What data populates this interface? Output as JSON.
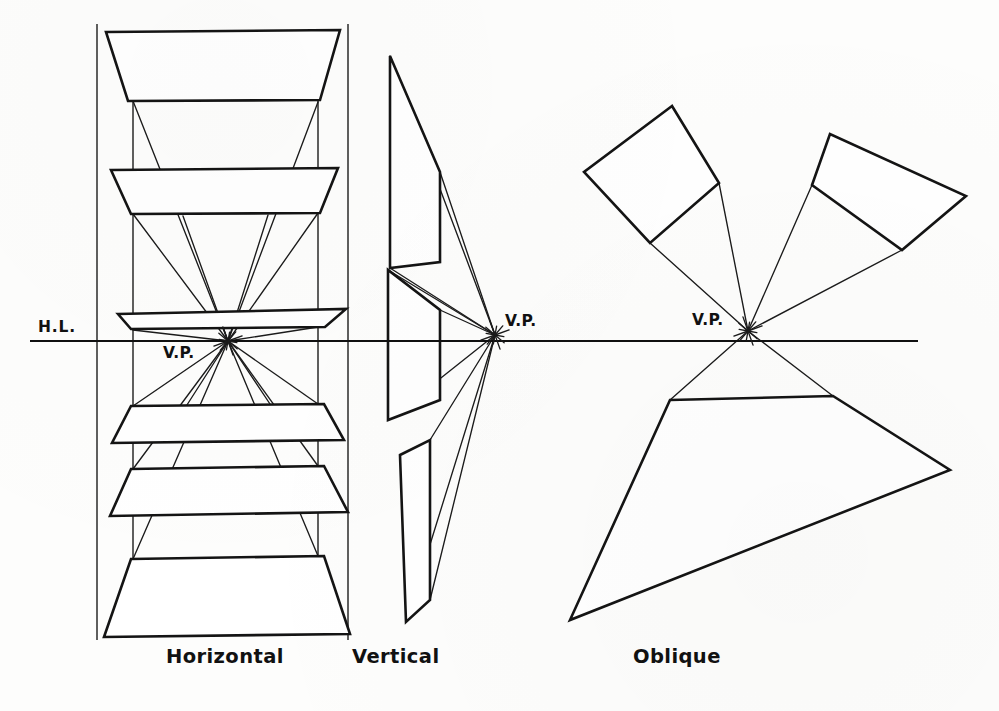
{
  "figure": {
    "kind": "perspective-construction-plate",
    "background_color": "#fdfdfc",
    "ink_color": "#151515",
    "horizon": {
      "label": "H.L.",
      "label_x": 38,
      "label_y": 332,
      "y": 341,
      "x_start": 30,
      "x_end": 918
    },
    "vanishing_points": [
      {
        "id": "vp-horizontal",
        "label": "V.P.",
        "x": 228,
        "y": 341,
        "label_x": 163,
        "label_y": 358
      },
      {
        "id": "vp-vertical",
        "label": "V.P.",
        "x": 495,
        "y": 335,
        "label_x": 505,
        "label_y": 326
      },
      {
        "id": "vp-oblique",
        "label": "V.P.",
        "x": 748,
        "y": 331,
        "label_x": 692,
        "label_y": 325
      }
    ],
    "captions": [
      {
        "id": "caption-horizontal",
        "text": "Horizontal",
        "x": 166,
        "y": 663
      },
      {
        "id": "caption-vertical",
        "text": "Vertical",
        "x": 352,
        "y": 663
      },
      {
        "id": "caption-oblique",
        "text": "Oblique",
        "x": 633,
        "y": 663
      }
    ],
    "groups": [
      {
        "id": "group-horizontal",
        "caption": "Horizontal",
        "description": "Six horizontal planes stacked above and below the horizon, each receding to the vanishing point.",
        "frame_lines": [
          {
            "x1": 97,
            "y1": 24,
            "x2": 97,
            "y2": 640
          },
          {
            "x1": 348,
            "y1": 24,
            "x2": 348,
            "y2": 640
          },
          {
            "x1": 133,
            "y1": 36,
            "x2": 133,
            "y2": 634
          },
          {
            "x1": 318,
            "y1": 36,
            "x2": 318,
            "y2": 634
          }
        ],
        "planes": [
          {
            "id": "h-plane-1",
            "hatch": "diag-down",
            "points": "106,32 340,30 320,100 128,101"
          },
          {
            "id": "h-plane-2",
            "hatch": "diag-down",
            "points": "111,170 338,168 320,213 131,214"
          },
          {
            "id": "h-plane-3",
            "hatch": "diag-down",
            "points": "118,314 346,309 325,327 131,329"
          },
          {
            "id": "h-plane-4",
            "hatch": "diag-down",
            "points": "131,406 324,404 344,440 112,443"
          },
          {
            "id": "h-plane-5",
            "hatch": "diag-down",
            "points": "131,469 324,466 348,512 110,516"
          },
          {
            "id": "h-plane-6",
            "hatch": "diag-down",
            "points": "131,559 324,556 350,634 104,637"
          }
        ],
        "rays": [
          {
            "x1": 133,
            "y1": 101,
            "x2": 228,
            "y2": 341
          },
          {
            "x1": 318,
            "y1": 102,
            "x2": 228,
            "y2": 341
          },
          {
            "x1": 133,
            "y1": 214,
            "x2": 228,
            "y2": 341
          },
          {
            "x1": 318,
            "y1": 213,
            "x2": 228,
            "y2": 341
          },
          {
            "x1": 183,
            "y1": 216,
            "x2": 228,
            "y2": 341
          },
          {
            "x1": 268,
            "y1": 215,
            "x2": 228,
            "y2": 341
          },
          {
            "x1": 133,
            "y1": 330,
            "x2": 228,
            "y2": 341
          },
          {
            "x1": 318,
            "y1": 327,
            "x2": 228,
            "y2": 341
          },
          {
            "x1": 133,
            "y1": 406,
            "x2": 228,
            "y2": 341
          },
          {
            "x1": 318,
            "y1": 404,
            "x2": 228,
            "y2": 341
          },
          {
            "x1": 185,
            "y1": 408,
            "x2": 228,
            "y2": 341
          },
          {
            "x1": 272,
            "y1": 407,
            "x2": 228,
            "y2": 341
          },
          {
            "x1": 133,
            "y1": 469,
            "x2": 228,
            "y2": 341
          },
          {
            "x1": 318,
            "y1": 466,
            "x2": 228,
            "y2": 341
          },
          {
            "x1": 133,
            "y1": 559,
            "x2": 228,
            "y2": 341
          },
          {
            "x1": 318,
            "y1": 556,
            "x2": 228,
            "y2": 341
          }
        ]
      },
      {
        "id": "group-vertical",
        "caption": "Vertical",
        "description": "Three vertical planes edge-on, their top and bottom edges converging at the vanishing point.",
        "planes": [
          {
            "id": "v-plane-1",
            "hatch": "diag-down",
            "points": "390,56 390,268 440,262 440,172"
          },
          {
            "id": "v-plane-2",
            "hatch": "diag-down",
            "points": "388,270 388,420 440,400 440,310"
          },
          {
            "id": "v-plane-3",
            "hatch": "diag-down",
            "points": "400,455 430,440 430,600 406,622"
          }
        ],
        "rays": [
          {
            "x1": 390,
            "y1": 56,
            "x2": 495,
            "y2": 335
          },
          {
            "x1": 440,
            "y1": 172,
            "x2": 495,
            "y2": 335
          },
          {
            "x1": 390,
            "y1": 268,
            "x2": 495,
            "y2": 335
          },
          {
            "x1": 388,
            "y1": 270,
            "x2": 495,
            "y2": 335
          },
          {
            "x1": 440,
            "y1": 310,
            "x2": 495,
            "y2": 335
          },
          {
            "x1": 388,
            "y1": 420,
            "x2": 495,
            "y2": 335
          },
          {
            "x1": 430,
            "y1": 440,
            "x2": 495,
            "y2": 335
          },
          {
            "x1": 406,
            "y1": 622,
            "x2": 495,
            "y2": 335
          },
          {
            "x1": 430,
            "y1": 600,
            "x2": 495,
            "y2": 335
          }
        ]
      },
      {
        "id": "group-oblique",
        "caption": "Oblique",
        "description": "Three tilted planes whose receding edges all converge at the vanishing point on the horizon.",
        "planes": [
          {
            "id": "o-plane-1",
            "hatch": "horizontal-lines",
            "points": "672,106 584,172 650,243 719,183"
          },
          {
            "id": "o-plane-2",
            "hatch": "diag-down",
            "points": "830,134 812,185 902,250 966,196"
          },
          {
            "id": "o-plane-3",
            "hatch": "diag-down",
            "points": "670,400 833,396 950,470 570,620"
          }
        ],
        "rays": [
          {
            "x1": 650,
            "y1": 243,
            "x2": 748,
            "y2": 331
          },
          {
            "x1": 719,
            "y1": 183,
            "x2": 748,
            "y2": 331
          },
          {
            "x1": 812,
            "y1": 185,
            "x2": 748,
            "y2": 331
          },
          {
            "x1": 902,
            "y1": 250,
            "x2": 748,
            "y2": 331
          },
          {
            "x1": 670,
            "y1": 400,
            "x2": 748,
            "y2": 331
          },
          {
            "x1": 833,
            "y1": 396,
            "x2": 748,
            "y2": 331
          }
        ]
      }
    ]
  }
}
